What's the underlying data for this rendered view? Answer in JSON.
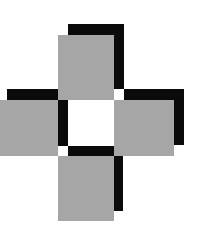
{
  "figure": {
    "colors": {
      "gray": "#a6a6a6",
      "black": "#0a0a0a",
      "background": "#ffffff"
    },
    "arms": [
      "top",
      "left",
      "right",
      "bottom"
    ]
  }
}
